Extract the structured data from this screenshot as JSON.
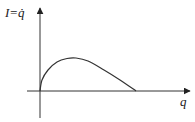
{
  "chart_data": {
    "type": "line",
    "title": "",
    "ylabel": "I=q̇",
    "xlabel": "q",
    "series": [
      {
        "name": "I(q)",
        "description": "Curve rising steeply from origin, peaking, then declining to zero on q-axis",
        "points_px": [
          [
            40,
            91
          ],
          [
            42,
            80
          ],
          [
            48,
            70
          ],
          [
            57,
            62
          ],
          [
            67,
            58.5
          ],
          [
            76,
            58
          ],
          [
            88,
            61
          ],
          [
            104,
            70
          ],
          [
            120,
            80
          ],
          [
            136,
            91
          ]
        ]
      }
    ],
    "axes": {
      "x_axis": {
        "label": "q",
        "ticks": []
      },
      "y_axis": {
        "label": "I=q̇",
        "ticks": []
      }
    },
    "grid": false
  },
  "labels": {
    "y_axis": "I=q̇",
    "x_axis": "q"
  },
  "colors": {
    "line": "#333333",
    "axis": "#333333"
  }
}
